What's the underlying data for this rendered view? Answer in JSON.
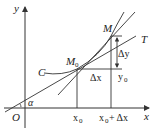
{
  "diagram": {
    "type": "derivative-tangent-illustration",
    "labels": {
      "y_axis": "y",
      "x_axis": "x",
      "origin": "O",
      "curve": "C",
      "point_m0": "M",
      "point_m0_sub": "0",
      "point_m": "M",
      "tangent": "T",
      "delta_y": "Δy",
      "delta_x": "Δx",
      "y0": "y",
      "y0_sub": "0",
      "x0": "x",
      "x0_sub": "0",
      "x0_plus_dx": "x",
      "x0_plus_dx_sub": "0",
      "x0_plus_dx_rest": "+ Δx",
      "angle": "α"
    },
    "colors": {
      "stroke": "#333333",
      "background": "#ffffff"
    }
  }
}
